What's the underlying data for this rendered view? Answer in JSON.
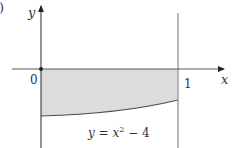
{
  "figure": {
    "corner_mark": ")",
    "axes": {
      "x_label": "x",
      "y_label": "y",
      "origin_label": "0",
      "x_tick_label": "1"
    },
    "curve": {
      "label_prefix": "y = x",
      "label_exponent": "2",
      "label_suffix": " − 4",
      "equation": "y = x^2 - 4"
    },
    "region": {
      "description": "Shaded region between x-axis and curve y = x^2 - 4 for 0 ≤ x ≤ 1"
    },
    "colors": {
      "axis": "#3a3a3a",
      "boundary_line": "#9a9a9a",
      "shade": "#dcdcdc",
      "curve": "#4a4a4a",
      "text": "#333333"
    }
  }
}
